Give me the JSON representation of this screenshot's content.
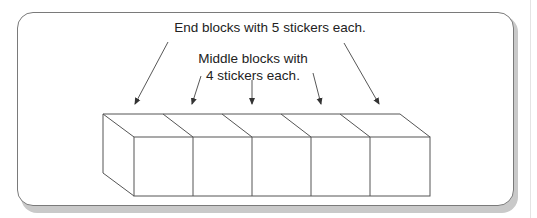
{
  "labels": {
    "end_blocks": "End blocks with 5 stickers each.",
    "middle_line1": "Middle blocks with",
    "middle_line2": "4 stickers each."
  },
  "blocks": {
    "count": 5,
    "end_stickers": 5,
    "middle_stickers": 4
  },
  "colors": {
    "line": "#555555",
    "panel_border": "#7a7a7a",
    "shadow": "#c9c9c9"
  }
}
